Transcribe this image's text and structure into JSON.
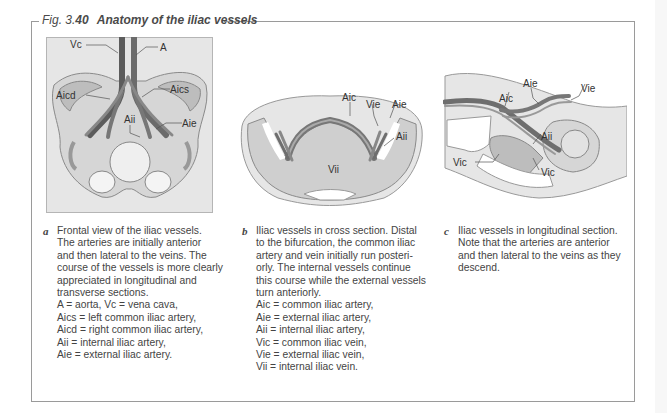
{
  "figure": {
    "number_prefix": "Fig. 3.",
    "number_bold": "40",
    "title": "Anatomy of the iliac vessels"
  },
  "panels": [
    {
      "letter": "a",
      "labels": {
        "vc": "Vc",
        "a": "A",
        "aicd": "Aicd",
        "aics": "Aics",
        "aii": "Aii",
        "aie": "Aie"
      },
      "legend_lines": [
        "Frontal view of the iliac vessels.",
        "The arteries are initially anterior",
        "and then lateral to the veins. The",
        "course of the vessels is more clearly",
        "appreciated in longitudinal and",
        "transverse sections.",
        "A = aorta, Vc = vena cava,",
        "Aics = left common iliac artery,",
        "Aicd = right common iliac artery,",
        "Aii = internal iliac artery,",
        "Aie = external iliac artery."
      ]
    },
    {
      "letter": "b",
      "labels": {
        "aic": "Aic",
        "vie": "Vie",
        "aie": "Aie",
        "aii": "Aii",
        "vii": "Vii"
      },
      "legend_lines": [
        "Iliac vessels in cross section. Distal",
        "to the bifurcation, the common iliac",
        "artery and vein initially run posteri-",
        "orly. The internal vessels continue",
        "this course while the external vessels",
        "turn anteriorly.",
        "Aic = common iliac artery,",
        "Aie = external iliac artery,",
        "Aii = internal iliac artery,",
        "Vic = common iliac vein,",
        "Vie = external iliac vein,",
        "Vii = internal iliac vein."
      ]
    },
    {
      "letter": "c",
      "labels": {
        "aie": "Aie",
        "vie": "Vie",
        "aic": "Aic",
        "aii": "Aii",
        "vic1": "Vic",
        "vic2": "Vic"
      },
      "legend_lines": [
        "Iliac vessels in longitudinal section.",
        "Note that the arteries are anterior",
        "and then lateral to the veins as they",
        "descend."
      ]
    }
  ],
  "colors": {
    "frame": "#9a9a9a",
    "tissue": "#e3e3e3",
    "bone": "#d0d0d0",
    "vessel": "#6e6e6e",
    "text": "#3a3a3a"
  }
}
